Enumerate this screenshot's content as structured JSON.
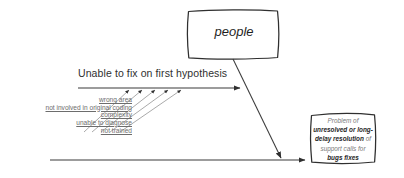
{
  "diagram": {
    "type": "fishbone-cause-and-effect",
    "category_box": {
      "label": "people"
    },
    "branch": {
      "heading": "Unable to fix on first hypothesis",
      "causes": [
        "wrong area",
        "not involved in original coding",
        "complexity",
        "unable to diagnose",
        "not trained"
      ]
    },
    "effect_box": {
      "line_1": "Problem of",
      "line_2": "unresolved or long-",
      "line_3_bold": "delay resolution",
      "line_3_plain": "of",
      "line_4": "support calls for",
      "line_5": "bugs fixes",
      "full_text": "Problem of unresolved or long-delay resolution of support calls for bugs fixes"
    },
    "colors": {
      "line": "#3a3a3a",
      "text": "#2b2b2b",
      "muted_text": "#7a7a7a",
      "background": "#ffffff"
    }
  }
}
